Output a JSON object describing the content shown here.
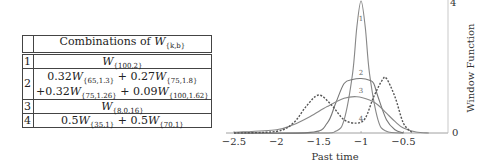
{
  "table": {
    "header": "Combinations of W_{k,b}",
    "header_prefix": "Combinations of ",
    "header_W": "W",
    "header_sub": "{k,b}",
    "rows": [
      {
        "num": "1",
        "lines": [
          [
            {
              "coef": "",
              "sub": "{100,2}"
            }
          ]
        ]
      },
      {
        "num": "2",
        "lines": [
          [
            {
              "coef": "0.32",
              "sub": "{65,1.3}"
            },
            {
              "coef": " + 0.27",
              "sub": "{75,1.8}"
            }
          ],
          [
            {
              "coef": "+0.32",
              "sub": "{75,1.26}"
            },
            {
              "coef": " + 0.09",
              "sub": "{100,1.62}"
            }
          ]
        ]
      },
      {
        "num": "3",
        "lines": [
          [
            {
              "coef": "",
              "sub": "{8,0.16}"
            }
          ]
        ]
      },
      {
        "num": "4",
        "lines": [
          [
            {
              "coef": "0.5",
              "sub": "{35,1}"
            },
            {
              "coef": " + 0.5",
              "sub": "{70,1}"
            }
          ]
        ]
      }
    ]
  },
  "chart_data": {
    "type": "line",
    "title": "",
    "xlabel": "Past time",
    "ylabel": "Window Function",
    "xlim": [
      -2.6,
      -0.05
    ],
    "ylim": [
      0,
      4
    ],
    "x_ticks": [
      "-2.5",
      "-2",
      "-1.5",
      "-1",
      "-0.5"
    ],
    "y_ticks": [
      "0",
      "4"
    ],
    "y_axis_position": "right",
    "grid": false,
    "series": [
      {
        "name": "1",
        "style": "solid",
        "x": [
          -2.5,
          -1.5,
          -1.3,
          -1.2,
          -1.1,
          -1.05,
          -1.0,
          -0.95,
          -0.9,
          -0.8,
          -0.7,
          -0.5
        ],
        "y": [
          0,
          0,
          0.05,
          0.4,
          1.8,
          3.2,
          4.0,
          3.2,
          1.8,
          0.4,
          0.05,
          0
        ]
      },
      {
        "name": "2",
        "style": "solid",
        "x": [
          -2.5,
          -1.6,
          -1.4,
          -1.3,
          -1.2,
          -1.1,
          -1.0,
          -0.9,
          -0.85,
          -0.8,
          -0.7,
          -0.6,
          -0.5
        ],
        "y": [
          0,
          0.02,
          0.3,
          0.9,
          1.5,
          1.62,
          1.65,
          1.6,
          1.5,
          1.1,
          0.4,
          0.1,
          0
        ]
      },
      {
        "name": "3",
        "style": "solid",
        "x": [
          -2.5,
          -2.0,
          -1.8,
          -1.6,
          -1.4,
          -1.2,
          -1.05,
          -0.9,
          -0.8,
          -0.7,
          -0.6,
          -0.5,
          -0.35,
          -0.2
        ],
        "y": [
          0.02,
          0.1,
          0.25,
          0.5,
          0.8,
          1.05,
          1.1,
          1.0,
          0.85,
          0.6,
          0.35,
          0.15,
          0.03,
          0
        ]
      },
      {
        "name": "4",
        "style": "dotted",
        "x": [
          -2.5,
          -2.0,
          -1.8,
          -1.65,
          -1.5,
          -1.35,
          -1.2,
          -1.05,
          -0.95,
          -0.85,
          -0.75,
          -0.7,
          -0.6,
          -0.5,
          -0.4
        ],
        "y": [
          0,
          0.05,
          0.3,
          0.8,
          1.15,
          0.85,
          0.4,
          0.3,
          0.45,
          1.1,
          1.6,
          1.65,
          1.1,
          0.3,
          0.02
        ]
      }
    ],
    "curve_labels": [
      "1",
      "2",
      "3",
      "4"
    ]
  }
}
